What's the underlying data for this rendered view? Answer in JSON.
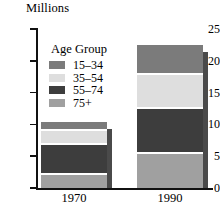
{
  "chart_data": {
    "type": "bar",
    "subtype": "stacked",
    "title": "",
    "ylabel": "Millions",
    "xlabel": "",
    "categories": [
      "1970",
      "1990"
    ],
    "ylim": [
      0,
      25
    ],
    "yticks": [
      0,
      5,
      10,
      15,
      20,
      25
    ],
    "ytick_labels": [
      "0",
      "5",
      "10",
      "15",
      "20",
      "25"
    ],
    "grid": false,
    "legend_title": "Age Group",
    "legend_position": "inside-upper-left",
    "stack_order_bottom_to_top": [
      "75+",
      "55-74",
      "35-54",
      "15-34"
    ],
    "series": [
      {
        "name": "15-34",
        "color": "#7b7b7b",
        "values": [
          1.3,
          4.6
        ]
      },
      {
        "name": "35-54",
        "color": "#d9d9d9",
        "values": [
          2.2,
          5.3
        ]
      },
      {
        "name": "55-74",
        "color": "#3d3d3d",
        "values": [
          4.7,
          7.1
        ]
      },
      {
        "name": "75+",
        "color": "#a0a0a0",
        "values": [
          2.2,
          5.5
        ]
      }
    ],
    "totals": [
      10.4,
      22.5
    ]
  },
  "axis": {
    "y_title": "Millions",
    "ticks": [
      {
        "label": "25",
        "value": 25
      },
      {
        "label": "20",
        "value": 20
      },
      {
        "label": "15",
        "value": 15
      },
      {
        "label": "10",
        "value": 10
      },
      {
        "label": "5",
        "value": 5
      },
      {
        "label": "0",
        "value": 0
      }
    ]
  },
  "legend": {
    "title": "Age Group",
    "items": [
      {
        "label": "15–34",
        "color": "#7b7b7b"
      },
      {
        "label": "35–54",
        "color": "#dedede"
      },
      {
        "label": "55–74",
        "color": "#3d3d3d"
      },
      {
        "label": "75+",
        "color": "#a0a0a0"
      }
    ]
  },
  "bars": [
    {
      "label": "1970",
      "total": 10.4,
      "segments": [
        {
          "name": "15–34",
          "value": 1.3,
          "from": 9.1,
          "to": 10.4,
          "color": "#7b7b7b"
        },
        {
          "name": "35–54",
          "value": 2.2,
          "from": 6.9,
          "to": 9.1,
          "color": "#dedede"
        },
        {
          "name": "55–74",
          "value": 4.7,
          "from": 2.2,
          "to": 6.9,
          "color": "#3d3d3d"
        },
        {
          "name": "75+",
          "value": 2.2,
          "from": 0.0,
          "to": 2.2,
          "color": "#a0a0a0"
        }
      ]
    },
    {
      "label": "1990",
      "total": 22.5,
      "segments": [
        {
          "name": "15–34",
          "value": 4.6,
          "from": 17.9,
          "to": 22.5,
          "color": "#7b7b7b"
        },
        {
          "name": "35–54",
          "value": 5.3,
          "from": 12.6,
          "to": 17.9,
          "color": "#dedede"
        },
        {
          "name": "55–74",
          "value": 7.1,
          "from": 5.5,
          "to": 12.6,
          "color": "#3d3d3d"
        },
        {
          "name": "75+",
          "value": 5.5,
          "from": 0.0,
          "to": 5.5,
          "color": "#a0a0a0"
        }
      ]
    }
  ],
  "geometry": {
    "y_zero_px": 188,
    "px_per_unit": 6.36,
    "bar_width_px": 66,
    "bar_left_px": [
      41,
      137
    ],
    "shadow_offset_px": 66,
    "shadow_top_shift_px": 7
  }
}
